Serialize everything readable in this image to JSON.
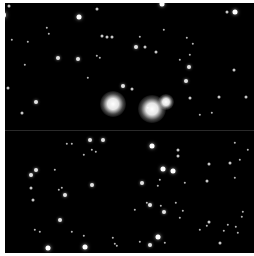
{
  "image": {
    "subject": "star field",
    "background_color": "#000000",
    "border_color": "#ffffff",
    "bright_stars": [
      {
        "x": 113,
        "y": 104,
        "r": 13
      },
      {
        "x": 152,
        "y": 109,
        "r": 14
      },
      {
        "x": 166,
        "y": 102,
        "r": 8
      }
    ],
    "stars": [
      [
        3,
        15,
        3
      ],
      [
        9,
        6,
        1.5
      ],
      [
        79,
        17,
        2.5
      ],
      [
        97,
        9,
        1.5
      ],
      [
        102,
        36,
        1.5
      ],
      [
        107,
        37,
        1.5
      ],
      [
        112,
        37,
        1.5
      ],
      [
        58,
        58,
        2
      ],
      [
        78,
        59,
        2
      ],
      [
        8,
        88,
        1.5
      ],
      [
        36,
        102,
        2
      ],
      [
        22,
        113,
        1.5
      ],
      [
        12,
        40,
        1.2
      ],
      [
        47,
        28,
        1.2
      ],
      [
        49,
        34,
        1.2
      ],
      [
        28,
        42,
        1.2
      ],
      [
        97,
        56,
        1.2
      ],
      [
        100,
        58,
        1.2
      ],
      [
        88,
        78,
        1.2
      ],
      [
        25,
        65,
        1.2
      ],
      [
        162,
        4,
        2.5
      ],
      [
        235,
        12,
        2.5
      ],
      [
        227,
        12,
        1.5
      ],
      [
        136,
        47,
        2
      ],
      [
        145,
        47,
        1.5
      ],
      [
        156,
        52,
        1.5
      ],
      [
        189,
        67,
        2
      ],
      [
        234,
        70,
        1.5
      ],
      [
        187,
        38,
        1.2
      ],
      [
        193,
        44,
        1.2
      ],
      [
        140,
        37,
        1.2
      ],
      [
        164,
        30,
        1.2
      ],
      [
        190,
        55,
        1.2
      ],
      [
        180,
        60,
        1.2
      ],
      [
        123,
        86,
        2
      ],
      [
        132,
        89,
        1.5
      ],
      [
        190,
        98,
        1.5
      ],
      [
        219,
        97,
        1.5
      ],
      [
        246,
        97,
        1.5
      ],
      [
        148,
        108,
        1.2
      ],
      [
        200,
        115,
        1.2
      ],
      [
        212,
        113,
        1.2
      ],
      [
        186,
        81,
        2
      ],
      [
        90,
        140,
        2
      ],
      [
        103,
        140,
        2
      ],
      [
        67,
        144,
        1.2
      ],
      [
        72,
        144,
        1.2
      ],
      [
        92,
        150,
        1.2
      ],
      [
        96,
        152,
        1.2
      ],
      [
        84,
        155,
        1.2
      ],
      [
        36,
        170,
        2
      ],
      [
        31,
        175,
        2
      ],
      [
        55,
        170,
        1.2
      ],
      [
        92,
        185,
        2
      ],
      [
        31,
        188,
        1.5
      ],
      [
        59,
        190,
        1.2
      ],
      [
        62,
        188,
        1.2
      ],
      [
        65,
        195,
        2
      ],
      [
        33,
        200,
        1.5
      ],
      [
        60,
        220,
        2
      ],
      [
        35,
        230,
        1.2
      ],
      [
        40,
        232,
        1.2
      ],
      [
        72,
        232,
        1.2
      ],
      [
        84,
        236,
        1.2
      ],
      [
        113,
        238,
        1.2
      ],
      [
        48,
        248,
        2.5
      ],
      [
        85,
        247,
        2.5
      ],
      [
        117,
        246,
        1.2
      ],
      [
        115,
        244,
        1.2
      ],
      [
        152,
        146,
        2.5
      ],
      [
        178,
        150,
        1.5
      ],
      [
        178,
        156,
        1.5
      ],
      [
        163,
        169,
        2.5
      ],
      [
        173,
        171,
        2.5
      ],
      [
        142,
        183,
        2
      ],
      [
        160,
        180,
        1.2
      ],
      [
        158,
        186,
        1.2
      ],
      [
        230,
        163,
        1.5
      ],
      [
        209,
        164,
        1.5
      ],
      [
        207,
        181,
        1.5
      ],
      [
        176,
        203,
        1.2
      ],
      [
        150,
        205,
        2
      ],
      [
        135,
        210,
        1.2
      ],
      [
        147,
        203,
        1.2
      ],
      [
        161,
        206,
        1.2
      ],
      [
        183,
        211,
        1.2
      ],
      [
        164,
        212,
        2
      ],
      [
        180,
        218,
        1.2
      ],
      [
        158,
        237,
        2.5
      ],
      [
        140,
        242,
        1.2
      ],
      [
        150,
        245,
        2
      ],
      [
        165,
        243,
        1.2
      ],
      [
        209,
        222,
        1.5
      ],
      [
        207,
        226,
        1.2
      ],
      [
        228,
        225,
        1.2
      ],
      [
        220,
        243,
        1.5
      ],
      [
        236,
        227,
        1.2
      ],
      [
        238,
        233,
        1.2
      ],
      [
        242,
        217,
        1.2
      ],
      [
        224,
        231,
        1.2
      ],
      [
        235,
        143,
        1.2
      ],
      [
        248,
        150,
        1.2
      ],
      [
        240,
        160,
        1.2
      ],
      [
        235,
        178,
        1.2
      ],
      [
        243,
        212,
        1.2
      ],
      [
        200,
        230,
        1.2
      ],
      [
        185,
        183,
        1.2
      ]
    ]
  }
}
